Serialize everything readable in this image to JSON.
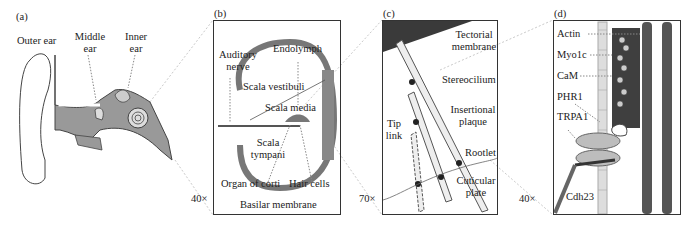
{
  "figure": {
    "panels": [
      {
        "id": "a",
        "letter": "(a)",
        "labels": {
          "outer_ear": "Outer ear",
          "middle_ear_1": "Middle",
          "middle_ear_2": "ear",
          "inner_ear_1": "Inner",
          "inner_ear_2": "ear"
        }
      },
      {
        "id": "b",
        "letter": "(b)",
        "labels": {
          "auditory_nerve_1": "Auditory",
          "auditory_nerve_2": "nerve",
          "endolymph": "Endolymph",
          "scala_vestibuli": "Scala vestibuli",
          "scala_media": "Scala media",
          "scala_tympani_1": "Scala",
          "scala_tympani_2": "tympani",
          "organ_of_corti": "Organ of corti",
          "hair_cells": "Hair cells",
          "basilar_membrane": "Basilar membrane"
        }
      },
      {
        "id": "c",
        "letter": "(c)",
        "labels": {
          "tectorial_1": "Tectorial",
          "tectorial_2": "membrane",
          "stereocilium": "Stereocilium",
          "insertional_1": "Insertional",
          "insertional_2": "plaque",
          "tip_link_1": "Tip",
          "tip_link_2": "link",
          "rootlet": "Rootlet",
          "cuticular_1": "Cuticular",
          "cuticular_2": "plate"
        }
      },
      {
        "id": "d",
        "letter": "(d)",
        "labels": {
          "actin": "Actin",
          "myo1c": "Myo1c",
          "cam": "CaM",
          "phr1": "PHR1",
          "trpa1": "TRPA1",
          "cdh23": "Cdh23"
        }
      }
    ],
    "magnifications": {
      "a_to_b": "40×",
      "b_to_c": "70×",
      "c_to_d": "40×"
    },
    "colors": {
      "tissue": "#8a8a8a",
      "dark": "#3a3a3a",
      "protein_dark": "#555555",
      "protein_light": "#bdbdbd"
    }
  }
}
